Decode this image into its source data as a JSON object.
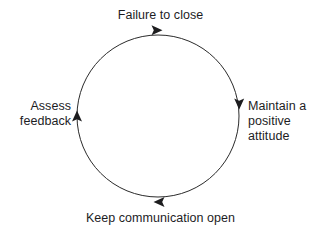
{
  "diagram": {
    "type": "cycle",
    "title": "",
    "direction": "clockwise",
    "background_color": "#ffffff",
    "line_color": "#2b2b2b",
    "text_color": "#1d1d1f",
    "circle": {
      "center_x": 158,
      "center_y": 116,
      "radius": 81,
      "stroke_width": 1
    },
    "nodes": [
      {
        "id": "failure-to-close",
        "position": "top",
        "label": "Failure to close"
      },
      {
        "id": "maintain-a-positive-attitude",
        "position": "right",
        "label": "Maintain a\npositive\nattitude"
      },
      {
        "id": "keep-communication-open",
        "position": "bottom",
        "label": "Keep communication open"
      },
      {
        "id": "assess-feedback",
        "position": "left",
        "label": "Assess\nfeedback"
      }
    ],
    "arrowheads": [
      {
        "id": "arrow-top",
        "at": "top",
        "points": "right",
        "x": 157,
        "y": 30
      },
      {
        "id": "arrow-right",
        "at": "right",
        "points": "down",
        "x": 239,
        "y": 104
      },
      {
        "id": "arrow-bottom",
        "at": "bottom",
        "points": "left",
        "x": 158,
        "y": 202
      },
      {
        "id": "arrow-left",
        "at": "left",
        "points": "up",
        "x": 77,
        "y": 115
      }
    ]
  }
}
